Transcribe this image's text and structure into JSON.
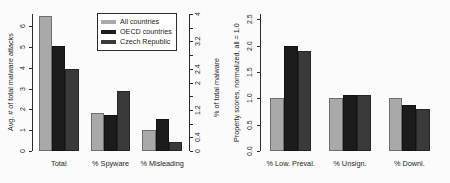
{
  "figure": {
    "background_color": "#fbfbfb",
    "series_colors": {
      "all_countries": "#a9a9a9",
      "oecd_countries": "#1c1c1c",
      "czech_republic": "#3a3a3a"
    }
  },
  "legend": {
    "entries": [
      {
        "label": "All countries",
        "color": "#a9a9a9",
        "swatch_name": "legend-swatch-all-countries"
      },
      {
        "label": "OECD countries",
        "color": "#1c1c1c",
        "swatch_name": "legend-swatch-oecd-countries"
      },
      {
        "label": "Czech Republic",
        "color": "#3a3a3a",
        "swatch_name": "legend-swatch-czech-republic"
      }
    ]
  },
  "chart_data": [
    {
      "type": "bar",
      "panel": "left",
      "title": "",
      "xlabel": "",
      "ylabel": "Avg. # of total malware attacks",
      "ylabel_secondary": "% of total malware",
      "categories": [
        "Total",
        "% Spyware",
        "% Misleading"
      ],
      "series": [
        {
          "name": "All countries",
          "color": "#a9a9a9",
          "values": [
            6.5,
            1.85,
            1.0
          ]
        },
        {
          "name": "OECD countries",
          "color": "#1c1c1c",
          "values": [
            5.05,
            1.75,
            1.55
          ]
        },
        {
          "name": "Czech Republic",
          "color": "#3a3a3a",
          "values": [
            3.95,
            2.9,
            0.45
          ]
        }
      ],
      "ylim": [
        0,
        6.6
      ],
      "yticks": [
        0,
        1,
        2,
        3,
        4,
        5,
        6
      ],
      "ytick_labels": [
        "0",
        "1",
        "2",
        "3",
        "4",
        "5",
        "6"
      ],
      "ylim_secondary": [
        0,
        4.0
      ],
      "yticks_secondary": [
        0,
        0.4,
        0.8,
        1.2,
        1.6,
        2.0,
        2.4,
        2.8,
        3.2,
        3.6,
        4.0
      ],
      "ytick_labels_secondary": [
        "0",
        "0.4",
        "",
        "1.2",
        "",
        "2",
        "2.4",
        "",
        "3.2",
        "",
        "4"
      ],
      "grid": false,
      "legend_position": "top-right"
    },
    {
      "type": "bar",
      "panel": "right",
      "title": "",
      "xlabel": "",
      "ylabel": "Property scores, normalized, all = 1.0",
      "categories": [
        "% Low. Preval.",
        "% Unsign.",
        "% Downl."
      ],
      "series": [
        {
          "name": "All countries",
          "color": "#a9a9a9",
          "values": [
            1.0,
            1.0,
            1.0
          ]
        },
        {
          "name": "OECD countries",
          "color": "#1c1c1c",
          "values": [
            2.0,
            1.06,
            0.87
          ]
        },
        {
          "name": "Czech Republic",
          "color": "#3a3a3a",
          "values": [
            1.9,
            1.06,
            0.79
          ]
        }
      ],
      "ylim": [
        0,
        2.6
      ],
      "yticks": [
        0.0,
        0.5,
        1.0,
        1.5,
        2.0,
        2.5
      ],
      "ytick_labels": [
        "0.0",
        "0.5",
        "1.0",
        "1.5",
        "2.0",
        "2.5"
      ],
      "grid": false,
      "legend_position": "top-right"
    }
  ]
}
